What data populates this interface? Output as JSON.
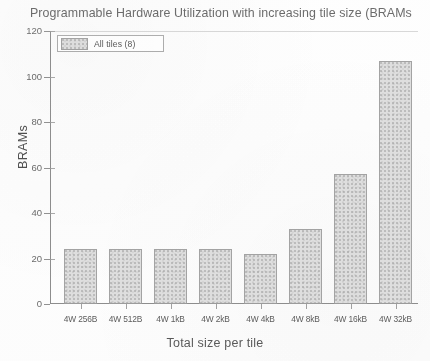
{
  "chart_data": {
    "type": "bar",
    "title": "Programmable Hardware Utilization with increasing tile size (BRAMs",
    "xlabel": "Total size per tile",
    "ylabel": "BRAMs",
    "categories": [
      "4W 256B",
      "4W 512B",
      "4W 1kB",
      "4W 2kB",
      "4W 4kB",
      "4W 8kB",
      "4W 16kB",
      "4W 32kB"
    ],
    "values": [
      24,
      24,
      24,
      24,
      22,
      33,
      57,
      107
    ],
    "series": [
      {
        "name": "All tiles (8)",
        "values": [
          24,
          24,
          24,
          24,
          22,
          33,
          57,
          107
        ]
      }
    ],
    "ylim": [
      0,
      120
    ],
    "yticks": [
      0,
      20,
      40,
      60,
      80,
      100,
      120
    ],
    "ytick_labels": [
      "0",
      "20",
      "40",
      "60",
      "80",
      "100",
      "120"
    ],
    "grid": false,
    "legend": {
      "position": "upper-left",
      "entries": [
        "All tiles (8)"
      ]
    },
    "bar_color": "#dcdcdc",
    "bar_edge_color": "#9d9d9d"
  },
  "legend": {
    "label": "All tiles (8)"
  }
}
